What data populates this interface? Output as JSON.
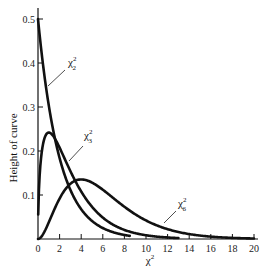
{
  "chart_data": {
    "type": "line",
    "title": "",
    "xlabel": "χ²",
    "ylabel": "Height of curve",
    "xlim": [
      0,
      20
    ],
    "ylim": [
      0,
      0.5
    ],
    "x_ticks": [
      0,
      2,
      4,
      6,
      8,
      10,
      12,
      14,
      16,
      18,
      20
    ],
    "y_ticks": [
      0.1,
      0.2,
      0.3,
      0.4,
      0.5
    ],
    "x_tick_labels": [
      "0",
      "2",
      "4",
      "6",
      "8",
      "10",
      "12",
      "14",
      "16",
      "18",
      "20"
    ],
    "y_tick_labels": [
      "0.1",
      "0.2",
      "0.3",
      "0.4",
      "0.5"
    ],
    "grid": false,
    "legend": "inline labels with leader lines",
    "series": [
      {
        "name": "χ²₂",
        "df": 2,
        "label_main": "χ",
        "label_sup": "2",
        "label_sub": "2",
        "x": [
          0,
          1,
          2,
          3,
          4,
          5,
          6,
          7,
          8,
          8.5
        ],
        "values": [
          0.5,
          0.303,
          0.184,
          0.112,
          0.068,
          0.041,
          0.025,
          0.015,
          0.009,
          0.007
        ]
      },
      {
        "name": "χ²₃",
        "df": 3,
        "label_main": "χ",
        "label_sup": "2",
        "label_sub": "3",
        "x": [
          0,
          0.5,
          1,
          2,
          3,
          4,
          5,
          6,
          8,
          10,
          12,
          13
        ],
        "values": [
          0,
          0.22,
          0.242,
          0.208,
          0.154,
          0.108,
          0.073,
          0.048,
          0.021,
          0.008,
          0.003,
          0.002
        ]
      },
      {
        "name": "χ²₆",
        "df": 6,
        "label_main": "χ",
        "label_sup": "2",
        "label_sub": "6",
        "x": [
          0,
          2,
          4,
          6,
          8,
          10,
          12,
          14,
          16,
          18,
          20
        ],
        "values": [
          0,
          0.037,
          0.068,
          0.075,
          0.061,
          0.042,
          0.027,
          0.016,
          0.009,
          0.005,
          0.002
        ]
      }
    ]
  },
  "axes": {
    "x_title": "χ",
    "x_title_sup": "2",
    "y_title": "Height of curve"
  }
}
